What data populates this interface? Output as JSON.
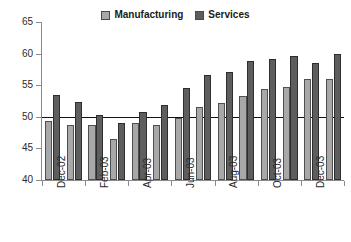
{
  "legend": {
    "position": "top-center",
    "entries": [
      {
        "label": "Manufacturing",
        "color": "#a8a8a8",
        "swatch": "manufacturing-swatch"
      },
      {
        "label": "Services",
        "color": "#5e5e5e",
        "swatch": "services-swatch"
      }
    ]
  },
  "axis": {
    "y_ticks": [
      "65",
      "60",
      "55",
      "50",
      "45",
      "40"
    ],
    "x_tick_labels": [
      "Dec-02",
      "Feb-03",
      "Apr-03",
      "Jun-03",
      "Aug-03",
      "Oct-03",
      "Dec-03"
    ]
  },
  "reference_line": {
    "value": 50,
    "color": "#111111"
  },
  "chart_data": {
    "type": "bar",
    "title": "",
    "subtitle": "",
    "xlabel": "",
    "ylabel": "",
    "ylim": [
      40,
      65
    ],
    "ytick_step": 5,
    "grid": false,
    "legend_position": "top-center",
    "annotations": [
      {
        "type": "hline",
        "y": 50,
        "label": ""
      }
    ],
    "categories": [
      "Dec-02",
      "Jan-03",
      "Feb-03",
      "Mar-03",
      "Apr-03",
      "May-03",
      "Jun-03",
      "Jul-03",
      "Aug-03",
      "Sep-03",
      "Oct-03",
      "Nov-03",
      "Dec-03",
      "Jan-04"
    ],
    "labeled_categories": [
      "Dec-02",
      "Feb-03",
      "Apr-03",
      "Jun-03",
      "Aug-03",
      "Oct-03",
      "Dec-03"
    ],
    "series": [
      {
        "name": "Manufacturing",
        "color": "#a8a8a8",
        "values": [
          49.3,
          48.7,
          48.7,
          46.5,
          49.0,
          48.7,
          49.8,
          51.6,
          52.2,
          53.3,
          54.4,
          54.7,
          56.0,
          56.0
        ]
      },
      {
        "name": "Services",
        "color": "#5e5e5e",
        "values": [
          53.4,
          52.4,
          50.3,
          49.1,
          50.7,
          51.9,
          54.5,
          56.6,
          57.1,
          58.8,
          59.1,
          59.7,
          58.5,
          59.9
        ]
      }
    ]
  }
}
